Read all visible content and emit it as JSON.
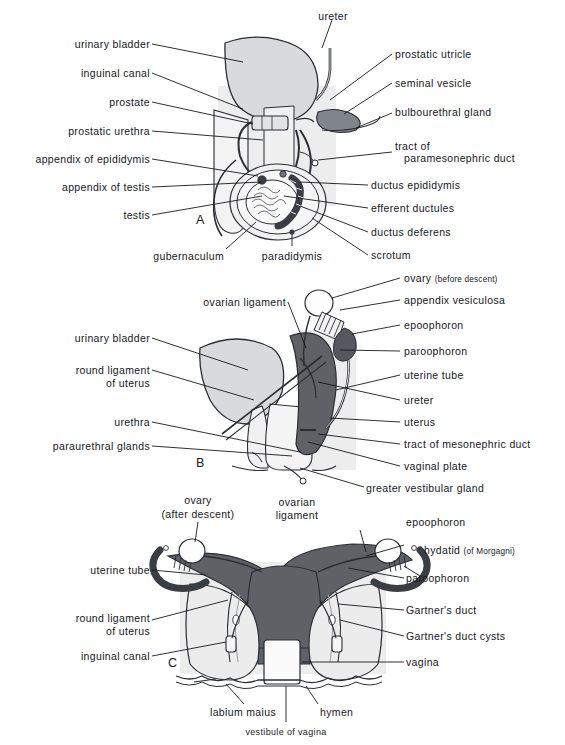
{
  "figure": {
    "panels": [
      {
        "id": "A",
        "letter": "A",
        "subject": "male genital ducts and descent of testis"
      },
      {
        "id": "B",
        "letter": "B",
        "subject": "female genital ducts, sagittal view"
      },
      {
        "id": "C",
        "letter": "C",
        "subject": "female genital ducts, frontal view"
      }
    ]
  },
  "colors": {
    "ink": "#16181c",
    "outline": "#2a2d33",
    "organ_dark": "#595d63",
    "organ_mid": "#8d9197",
    "organ_light": "#d9dadb",
    "organ_pale": "#ececec",
    "shadow_band": "#e6e7e8",
    "paper": "#ffffff"
  },
  "panel_a": {
    "letter": "A",
    "labels_left": [
      {
        "text": "urinary bladder"
      },
      {
        "text": "inguinal canal"
      },
      {
        "text": "prostate"
      },
      {
        "text": "prostatic urethra"
      },
      {
        "text": "appendix of  epididymis"
      },
      {
        "text": "appendix of testis"
      },
      {
        "text": "testis"
      }
    ],
    "labels_right": [
      {
        "text": "prostatic utricle"
      },
      {
        "text": "seminal vesicle"
      },
      {
        "text": "bulbourethral gland"
      },
      {
        "text": "tract of"
      },
      {
        "text": "paramesonephric duct"
      },
      {
        "text": "ductus epididymis"
      },
      {
        "text": "efferent ductules"
      },
      {
        "text": "ductus deferens"
      },
      {
        "text": "scrotum"
      }
    ],
    "labels_top": [
      {
        "text": "ureter"
      }
    ],
    "labels_bottom": [
      {
        "text": "gubernaculum"
      },
      {
        "text": "paradidymis"
      }
    ]
  },
  "panel_b": {
    "letter": "B",
    "labels_left": [
      {
        "text": "ovarian ligament"
      },
      {
        "text": "urinary bladder"
      },
      {
        "text": "round ligament",
        "text2": "of uterus"
      },
      {
        "text": "urethra"
      },
      {
        "text": "paraurethral glands"
      }
    ],
    "labels_right": [
      {
        "text": "ovary",
        "note": "(before descent)"
      },
      {
        "text": "appendix vesiculosa"
      },
      {
        "text": "epoophoron"
      },
      {
        "text": "paroophoron"
      },
      {
        "text": "uterine tube"
      },
      {
        "text": "ureter"
      },
      {
        "text": "uterus"
      },
      {
        "text": "tract of mesonephric duct"
      },
      {
        "text": "vaginal plate"
      },
      {
        "text": "greater vestibular gland"
      }
    ]
  },
  "panel_c": {
    "letter": "C",
    "labels_left": [
      {
        "text": "uterine tube"
      },
      {
        "text": "round ligament",
        "text2": "of uterus"
      },
      {
        "text": "inguinal canal"
      }
    ],
    "labels_right": [
      {
        "text": "epoophoron"
      },
      {
        "text": "hydatid",
        "note": "(of Morgagni)"
      },
      {
        "text": "paroophoron"
      },
      {
        "text": "Gartner's  duct"
      },
      {
        "text": "Gartner's duct cysts"
      },
      {
        "text": "vagina"
      }
    ],
    "labels_top": [
      {
        "text": "ovary",
        "text2": "(after descent)"
      },
      {
        "text": "ovarian",
        "text2": "ligament"
      }
    ],
    "labels_bottom": [
      {
        "text": "labium  maius"
      },
      {
        "text": "hymen"
      },
      {
        "text": "vestibule of vagina"
      }
    ]
  }
}
